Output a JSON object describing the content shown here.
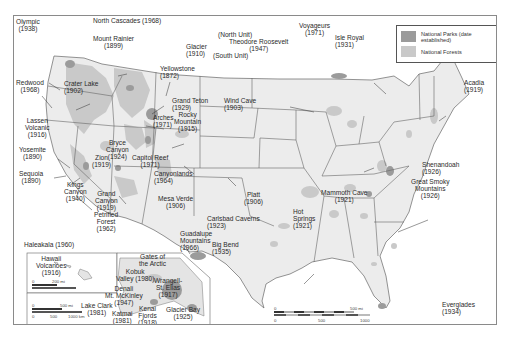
{
  "colors": {
    "park": "#9b9b9b",
    "forest": "#c9c9c9",
    "land": "#ececec",
    "border": "#555555",
    "frame": "#8a8a8a"
  },
  "legend": {
    "items": [
      {
        "label": "National Parks (date established)",
        "swatch": "park"
      },
      {
        "label": "National Forests",
        "swatch": "forest"
      }
    ]
  },
  "parks": [
    {
      "name": "Olympic",
      "year": "(1938)"
    },
    {
      "name": "North Cascades (1968)",
      "year": ""
    },
    {
      "name": "Mount Rainier",
      "year": "(1899)"
    },
    {
      "name": "Glacier",
      "year": "(1910)"
    },
    {
      "name": "Redwood",
      "year": "(1968)"
    },
    {
      "name": "Crater Lake",
      "year": "(1902)"
    },
    {
      "name": "Yellowstone",
      "year": "(1872)"
    },
    {
      "name": "Grand Teton",
      "year": "(1929)"
    },
    {
      "name": "Lassen Volcanic",
      "year": "(1916)"
    },
    {
      "name": "Arches",
      "year": "(1971)"
    },
    {
      "name": "Rocky Mountain",
      "year": "(1915)"
    },
    {
      "name": "Yosemite",
      "year": "(1890)"
    },
    {
      "name": "Bryce Canyon",
      "year": "(1924)"
    },
    {
      "name": "Zion",
      "year": "(1919)"
    },
    {
      "name": "Capitol Reef",
      "year": "(1971)"
    },
    {
      "name": "Canyonlands",
      "year": "(1964)"
    },
    {
      "name": "Sequoia",
      "year": "(1890)"
    },
    {
      "name": "Kings Canyon",
      "year": "(1940)"
    },
    {
      "name": "Grand Canyon",
      "year": "(1919)"
    },
    {
      "name": "Mesa Verde",
      "year": "(1906)"
    },
    {
      "name": "Petrified Forest",
      "year": "(1962)"
    },
    {
      "name": "Theodore Roosevelt",
      "year": "(1947)",
      "north": "(North Unit)",
      "south": "(South Unit)"
    },
    {
      "name": "Wind Cave",
      "year": "(1903)"
    },
    {
      "name": "Voyageurs",
      "year": "(1971)"
    },
    {
      "name": "Isle Royal",
      "year": "(1931)"
    },
    {
      "name": "Acadia",
      "year": "(1919)"
    },
    {
      "name": "Platt",
      "year": "(1906)"
    },
    {
      "name": "Carlsbad Caverns",
      "year": "(1923)"
    },
    {
      "name": "Guadalupe Mountains",
      "year": "(1966)"
    },
    {
      "name": "Big Bend",
      "year": "(1935)"
    },
    {
      "name": "Hot Springs",
      "year": "(1921)"
    },
    {
      "name": "Mammoth Cave",
      "year": "(1921)"
    },
    {
      "name": "Shenandoah",
      "year": "(1926)"
    },
    {
      "name": "Great Smoky Mountains",
      "year": "(1926)"
    },
    {
      "name": "Everglades",
      "year": "(1934)"
    }
  ],
  "insets": {
    "hawaii": {
      "header": "Haleakala (1960)",
      "park_name": "Hawaii Volcanoes",
      "park_year": "(1916)",
      "scale_mi": [
        "0",
        "200 mi"
      ],
      "scale_km": [
        "0",
        "200",
        "4000 km"
      ]
    },
    "alaska": {
      "scale_mi": [
        "0",
        "500 mi"
      ],
      "scale_km": [
        "0",
        "500",
        "1000 km"
      ],
      "parks": [
        {
          "name": "Gates of the Arctic",
          "year": "(1980)"
        },
        {
          "name": "Kobuk Valley",
          "year": "(1980)"
        },
        {
          "name": "Denali",
          "year": ""
        },
        {
          "name": "Mt. McKinley",
          "year": "(1917)"
        },
        {
          "name": "Wrangell-St. Elias",
          "year": "(1917)"
        },
        {
          "name": "Lake Clark",
          "year": "(1981)"
        },
        {
          "name": "Katmai",
          "year": "(1981)"
        },
        {
          "name": "Kenai Fjords",
          "year": "(1918)"
        },
        {
          "name": "Glacier Bay",
          "year": "(1925)"
        }
      ]
    }
  },
  "main_scale": {
    "mi": [
      "0",
      "500 mi"
    ],
    "km": [
      "0",
      "500",
      "1000 km"
    ]
  }
}
